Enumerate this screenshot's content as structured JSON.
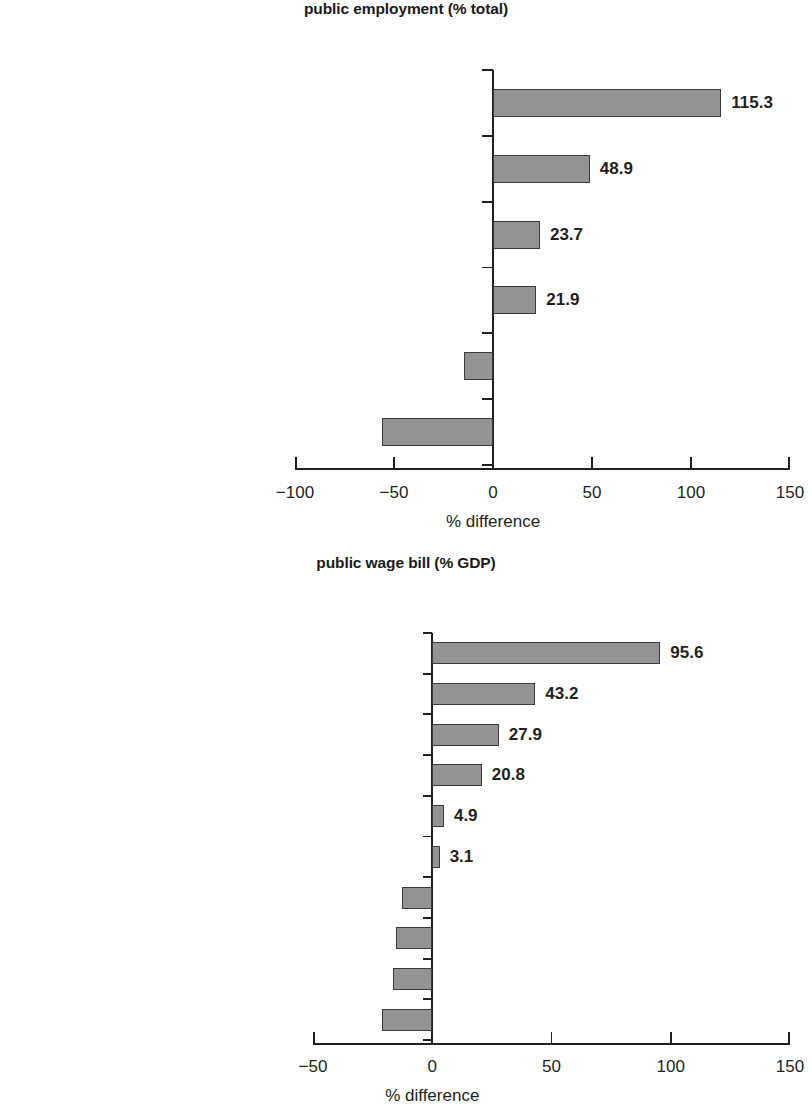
{
  "chart_data": [
    {
      "type": "bar",
      "orientation": "horizontal",
      "title": "public employment (% total)",
      "xlabel": "% difference",
      "ylabel": "",
      "categories": [
        "Egypt, Arab Rep.",
        "Jordan",
        "Syrian Arab Republic",
        "West Bank and Gaza economy",
        "Iran, Islamic Rep.",
        "Morocco"
      ],
      "values": [
        115.3,
        48.9,
        23.7,
        21.9,
        -14.5,
        -56.1
      ],
      "value_labels": [
        "115.3",
        "48.9",
        "23.7",
        "21.9",
        "−14.5",
        "−56.1"
      ],
      "xlim": [
        -100,
        150
      ],
      "xticks": [
        -100,
        -50,
        0,
        50,
        100,
        150
      ],
      "xtick_labels": [
        "−100",
        "−50",
        "0",
        "50",
        "100",
        "150"
      ],
      "grid": false,
      "legend": false,
      "bar_color": "#939393",
      "bar_edge_color": "#3a3a3a"
    },
    {
      "type": "bar",
      "orientation": "horizontal",
      "title": "public wage bill (% GDP)",
      "xlabel": "% difference",
      "ylabel": "",
      "categories": [
        "West Bank and Gaza economy",
        "Jordan",
        "Libya",
        "Morocco",
        "Lebanon",
        "Yemen, Rep.",
        "Algeria",
        "Syrian Arab Republic",
        "Iran, Islamic Rep.",
        "Egypt, Arab Rep."
      ],
      "values": [
        95.6,
        43.2,
        27.9,
        20.8,
        4.9,
        3.1,
        -12.7,
        -15.3,
        -16.3,
        -21.1
      ],
      "value_labels": [
        "95.6",
        "43.2",
        "27.9",
        "20.8",
        "4.9",
        "3.1",
        "−12.7",
        "−15.3",
        "−16.3",
        "−21.1"
      ],
      "xlim": [
        -50,
        150
      ],
      "xticks": [
        -50,
        0,
        50,
        100,
        150
      ],
      "xtick_labels": [
        "−50",
        "0",
        "50",
        "100",
        "150"
      ],
      "grid": false,
      "legend": false,
      "bar_color": "#939393",
      "bar_edge_color": "#3a3a3a"
    }
  ]
}
